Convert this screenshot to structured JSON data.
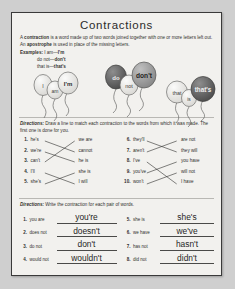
{
  "worksheet": {
    "title": "Contractions",
    "intro_pre": "A ",
    "intro_b1": "contraction",
    "intro_mid": " is a word made up of two words joined together with one or more letters left out. An ",
    "intro_b2": "apostrophe",
    "intro_post": " is used in place of the missing letters.",
    "examples_label": "Examples:",
    "examples": [
      {
        "words": "I am",
        "dash": "—",
        "contraction": "I'm"
      },
      {
        "words": "do not",
        "dash": "—",
        "contraction": "don't"
      },
      {
        "words": "that is",
        "dash": "—",
        "contraction": "that's"
      }
    ],
    "balloon_groups": [
      {
        "name": "i-am-group",
        "balloons": [
          {
            "label": "I",
            "shade": "light"
          },
          {
            "label": "am",
            "shade": "light"
          },
          {
            "label": "I'm",
            "shade": "light"
          }
        ]
      },
      {
        "name": "do-not-group",
        "balloons": [
          {
            "label": "do",
            "shade": "dark"
          },
          {
            "label": "not",
            "shade": "light"
          },
          {
            "label": "don't",
            "shade": "medium"
          }
        ]
      },
      {
        "name": "that-is-group",
        "balloons": [
          {
            "label": "that",
            "shade": "light"
          },
          {
            "label": "is",
            "shade": "light"
          },
          {
            "label": "that's",
            "shade": "dark"
          }
        ]
      }
    ],
    "directions_1_label": "Directions:",
    "directions_1_text": " Draw a line to match each contraction to the words from which it was made. The first one is done for you.",
    "match_left": [
      {
        "num": "1.",
        "contraction": "he's",
        "words": "we are"
      },
      {
        "num": "2.",
        "contraction": "we're",
        "words": "cannot"
      },
      {
        "num": "3.",
        "contraction": "can't",
        "words": "he is"
      },
      {
        "num": "4.",
        "contraction": "I'll",
        "words": "she is"
      },
      {
        "num": "5.",
        "contraction": "she's",
        "words": "I will"
      }
    ],
    "match_right": [
      {
        "num": "6.",
        "contraction": "they'll",
        "words": "are not"
      },
      {
        "num": "7.",
        "contraction": "aren't",
        "words": "they will"
      },
      {
        "num": "8.",
        "contraction": "I've",
        "words": "you have"
      },
      {
        "num": "9.",
        "contraction": "you've",
        "words": "will not"
      },
      {
        "num": "10.",
        "contraction": "won't",
        "words": "I have"
      }
    ],
    "directions_2_label": "Directions:",
    "directions_2_text": " Write the contraction for each pair of words.",
    "write_left": [
      {
        "num": "1.",
        "pair": "you are",
        "answer": "you're"
      },
      {
        "num": "2.",
        "pair": "does not",
        "answer": "doesn't"
      },
      {
        "num": "3.",
        "pair": "do not",
        "answer": "don't"
      },
      {
        "num": "4.",
        "pair": "would not",
        "answer": "wouldn't"
      }
    ],
    "write_right": [
      {
        "num": "5.",
        "pair": "she is",
        "answer": "she's"
      },
      {
        "num": "6.",
        "pair": "we have",
        "answer": "we've"
      },
      {
        "num": "7.",
        "pair": "has not",
        "answer": "hasn't"
      },
      {
        "num": "8.",
        "pair": "did not",
        "answer": "didn't"
      }
    ]
  }
}
